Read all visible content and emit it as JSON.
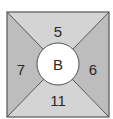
{
  "diagram": {
    "center_label": "B",
    "regions": {
      "top": {
        "label": "5",
        "fill": "#d4d4d4"
      },
      "right": {
        "label": "6",
        "fill": "#bdbdbd"
      },
      "bottom": {
        "label": "11",
        "fill": "#d4d4d4"
      },
      "left": {
        "label": "7",
        "fill": "#bdbdbd"
      }
    },
    "colors": {
      "border": "#555555",
      "circle_fill": "#ffffff",
      "text": "#2a2a2a"
    }
  }
}
